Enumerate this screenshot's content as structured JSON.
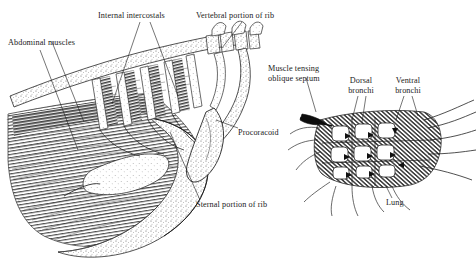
{
  "figure": {
    "background_color": "#ffffff",
    "ink_color": "#1a1a1a",
    "style": "black-and-white engraved line drawing with stipple and hatching",
    "panels": [
      {
        "id": "left",
        "name": "rib-cage-and-sternum-panel"
      },
      {
        "id": "right",
        "name": "lung-parabronchi-panel"
      }
    ]
  },
  "labels": {
    "abdominal_muscles": "Abdominal muscles",
    "internal_intercostals": "Internal intercostals",
    "vertebral_portion_of_rib": "Vertebral portion of rib",
    "procoracoid": "Procoracoid",
    "sternal_portion_of_rib": "Sternal portion of rib",
    "muscle_tensing_oblique_septum_line1": "Muscle tensing",
    "muscle_tensing_oblique_septum_line2": "oblique septum",
    "dorsal_bronchi_line1": "Dorsal",
    "dorsal_bronchi_line2": "bronchi",
    "ventral_bronchi_line1": "Ventral",
    "ventral_bronchi_line2": "bronchi",
    "lung": "Lung"
  },
  "annotations": {
    "septum_arrow": "solid-black-wedge-arrow-pointing-left",
    "airflow_arrows": "small black arrowheads indicating air flow through parabronchi"
  }
}
